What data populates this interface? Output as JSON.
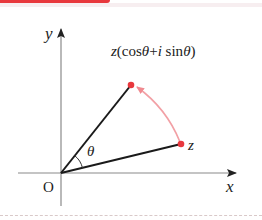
{
  "figure": {
    "axes": {
      "x_label": "x",
      "y_label": "y",
      "origin_label": "O"
    },
    "points": [
      {
        "id": "z",
        "label": "z",
        "color": "#e8383d"
      },
      {
        "id": "z_rot",
        "label": "z(cosθ+i sinθ)",
        "color": "#e8383d"
      }
    ],
    "angle_label": "θ",
    "rotation_arc_color": "#f2a0a5",
    "accent_color": "#e8383d"
  }
}
